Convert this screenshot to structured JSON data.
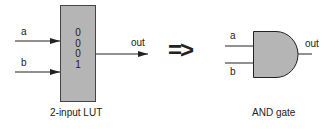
{
  "lut": {
    "input_a": "a",
    "input_b": "b",
    "bits": [
      "0",
      "0",
      "0",
      "1"
    ],
    "output": "out",
    "caption": "2-input LUT",
    "fill_color": "#b5b5b5"
  },
  "arrow": "=>",
  "gate": {
    "input_a": "a",
    "input_b": "b",
    "output": "out",
    "caption": "AND gate",
    "fill_color": "#b5b5b5"
  }
}
